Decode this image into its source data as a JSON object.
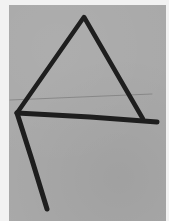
{
  "image": {
    "description": "Photo of a hand-drawn glyph on gray paper: a triangle with a horizontal base extended to the right and a diagonal stroke descending from the left vertex",
    "colors": {
      "margin": "#f2f2f2",
      "paper": "#a9a9a9",
      "ink": "#1e1e1e",
      "crease": "#7a7a7a"
    },
    "strokes": {
      "triangle_left_leg": {
        "x1": 17,
        "y1": 113,
        "x2": 84,
        "y2": 17
      },
      "triangle_right_leg": {
        "x1": 84,
        "y1": 17,
        "x2": 143,
        "y2": 119
      },
      "base_line": {
        "x1": 17,
        "y1": 113,
        "x2": 157,
        "y2": 123
      },
      "descender": {
        "x1": 17,
        "y1": 113,
        "x2": 47,
        "y2": 209
      },
      "crease": {
        "x1": 10,
        "y1": 100,
        "x2": 152,
        "y2": 94
      }
    }
  }
}
